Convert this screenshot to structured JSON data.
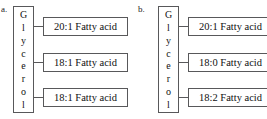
{
  "panels": [
    {
      "id": "a",
      "label": "a.",
      "backbone": {
        "name": "Glycerol",
        "letters": [
          "G",
          "l",
          "y",
          "c",
          "e",
          "r",
          "o",
          "l"
        ]
      },
      "fatty_acids": [
        {
          "label": "20:1 Fatty acid",
          "carbons": 20,
          "double_bonds": 1
        },
        {
          "label": "18:1 Fatty acid",
          "carbons": 18,
          "double_bonds": 1
        },
        {
          "label": "18:1 Fatty acid",
          "carbons": 18,
          "double_bonds": 1
        }
      ]
    },
    {
      "id": "b",
      "label": "b.",
      "backbone": {
        "name": "Glycerol",
        "letters": [
          "G",
          "l",
          "y",
          "c",
          "e",
          "r",
          "o",
          "l"
        ]
      },
      "fatty_acids": [
        {
          "label": "20:1 Fatty acid",
          "carbons": 20,
          "double_bonds": 1
        },
        {
          "label": "18:0 Fatty acid",
          "carbons": 18,
          "double_bonds": 0
        },
        {
          "label": "18:2 Fatty acid",
          "carbons": 18,
          "double_bonds": 2
        }
      ]
    }
  ],
  "colors": {
    "border": "#58585a",
    "text": "#111111",
    "background": "#ffffff"
  }
}
